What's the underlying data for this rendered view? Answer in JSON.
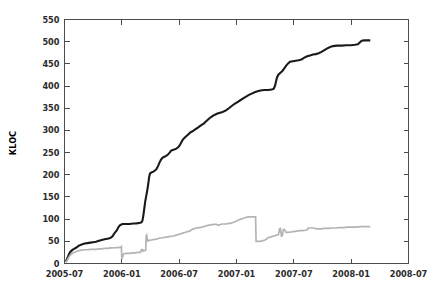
{
  "chart_data": {
    "type": "line",
    "title": "",
    "subtitle": "",
    "xlabel": "",
    "ylabel": "KLOC",
    "grid": false,
    "legend": "none",
    "xlim": [
      0,
      36
    ],
    "ylim": [
      0,
      550
    ],
    "x_tick_labels": [
      "2005-07",
      "2006-01",
      "2006-07",
      "2007-01",
      "2007-07",
      "2008-01",
      "2008-07"
    ],
    "x_tick_values": [
      0,
      6,
      12,
      18,
      24,
      30,
      36
    ],
    "y_tick_labels": [
      "0",
      "50",
      "100",
      "150",
      "200",
      "250",
      "300",
      "350",
      "400",
      "450",
      "500",
      "550"
    ],
    "y_tick_values": [
      0,
      50,
      100,
      150,
      200,
      250,
      300,
      350,
      400,
      450,
      500,
      550
    ],
    "series": [
      {
        "name": "total-lines",
        "color": "#1a1a1a",
        "width": 2.1,
        "points": [
          [
            0.15,
            4
          ],
          [
            0.3,
            12
          ],
          [
            0.45,
            20
          ],
          [
            0.6,
            26
          ],
          [
            0.8,
            30
          ],
          [
            1.0,
            33
          ],
          [
            1.25,
            36
          ],
          [
            1.5,
            40
          ],
          [
            1.8,
            43
          ],
          [
            2.1,
            45
          ],
          [
            2.4,
            46
          ],
          [
            2.7,
            47
          ],
          [
            3.0,
            48
          ],
          [
            3.3,
            49
          ],
          [
            3.6,
            51
          ],
          [
            3.9,
            53
          ],
          [
            4.1,
            54
          ],
          [
            4.3,
            55
          ],
          [
            4.5,
            56
          ],
          [
            4.7,
            57
          ],
          [
            4.9,
            59
          ],
          [
            5.05,
            62
          ],
          [
            5.15,
            66
          ],
          [
            5.3,
            70
          ],
          [
            5.45,
            74
          ],
          [
            5.55,
            78
          ],
          [
            5.65,
            82
          ],
          [
            5.8,
            86
          ],
          [
            5.95,
            88
          ],
          [
            6.1,
            89
          ],
          [
            6.4,
            89
          ],
          [
            6.8,
            89
          ],
          [
            7.2,
            90
          ],
          [
            7.5,
            90
          ],
          [
            7.7,
            91
          ],
          [
            7.9,
            92
          ],
          [
            8.05,
            93
          ],
          [
            8.15,
            96
          ],
          [
            8.25,
            108
          ],
          [
            8.35,
            124
          ],
          [
            8.45,
            140
          ],
          [
            8.55,
            152
          ],
          [
            8.62,
            160
          ],
          [
            8.7,
            170
          ],
          [
            8.78,
            182
          ],
          [
            8.86,
            195
          ],
          [
            8.95,
            203
          ],
          [
            9.1,
            205
          ],
          [
            9.3,
            207
          ],
          [
            9.5,
            210
          ],
          [
            9.65,
            214
          ],
          [
            9.8,
            220
          ],
          [
            9.95,
            228
          ],
          [
            10.1,
            234
          ],
          [
            10.25,
            238
          ],
          [
            10.4,
            240
          ],
          [
            10.6,
            242
          ],
          [
            10.8,
            245
          ],
          [
            11.0,
            250
          ],
          [
            11.15,
            254
          ],
          [
            11.3,
            256
          ],
          [
            11.5,
            257
          ],
          [
            11.7,
            259
          ],
          [
            11.9,
            262
          ],
          [
            12.05,
            266
          ],
          [
            12.2,
            272
          ],
          [
            12.35,
            278
          ],
          [
            12.5,
            282
          ],
          [
            12.65,
            285
          ],
          [
            12.8,
            288
          ],
          [
            13.0,
            292
          ],
          [
            13.2,
            296
          ],
          [
            13.4,
            298
          ],
          [
            13.6,
            301
          ],
          [
            13.8,
            304
          ],
          [
            14.0,
            307
          ],
          [
            14.2,
            310
          ],
          [
            14.4,
            313
          ],
          [
            14.6,
            316
          ],
          [
            14.8,
            320
          ],
          [
            15.0,
            324
          ],
          [
            15.2,
            328
          ],
          [
            15.4,
            331
          ],
          [
            15.6,
            334
          ],
          [
            15.8,
            336
          ],
          [
            16.0,
            338
          ],
          [
            16.3,
            340
          ],
          [
            16.6,
            342
          ],
          [
            16.9,
            345
          ],
          [
            17.2,
            350
          ],
          [
            17.5,
            355
          ],
          [
            17.8,
            360
          ],
          [
            18.1,
            364
          ],
          [
            18.4,
            368
          ],
          [
            18.7,
            372
          ],
          [
            19.0,
            376
          ],
          [
            19.3,
            380
          ],
          [
            19.6,
            383
          ],
          [
            19.9,
            386
          ],
          [
            20.2,
            388
          ],
          [
            20.5,
            390
          ],
          [
            20.9,
            391
          ],
          [
            21.3,
            391
          ],
          [
            21.7,
            392
          ],
          [
            21.9,
            394
          ],
          [
            22.05,
            402
          ],
          [
            22.15,
            412
          ],
          [
            22.25,
            420
          ],
          [
            22.4,
            426
          ],
          [
            22.6,
            430
          ],
          [
            22.8,
            434
          ],
          [
            23.0,
            440
          ],
          [
            23.2,
            446
          ],
          [
            23.4,
            451
          ],
          [
            23.6,
            455
          ],
          [
            23.9,
            456
          ],
          [
            24.2,
            457
          ],
          [
            24.5,
            458
          ],
          [
            24.8,
            460
          ],
          [
            25.1,
            464
          ],
          [
            25.4,
            467
          ],
          [
            25.7,
            469
          ],
          [
            26.0,
            471
          ],
          [
            26.3,
            472
          ],
          [
            26.6,
            474
          ],
          [
            26.9,
            477
          ],
          [
            27.2,
            481
          ],
          [
            27.5,
            485
          ],
          [
            27.8,
            488
          ],
          [
            28.1,
            490
          ],
          [
            28.5,
            491
          ],
          [
            29.0,
            491
          ],
          [
            29.5,
            492
          ],
          [
            30.0,
            492
          ],
          [
            30.4,
            493
          ],
          [
            30.7,
            494
          ],
          [
            30.9,
            498
          ],
          [
            31.1,
            502
          ],
          [
            31.4,
            503
          ],
          [
            31.8,
            503
          ],
          [
            32.0,
            503
          ]
        ]
      },
      {
        "name": "active-lines",
        "color": "#b4b4b4",
        "width": 1.7,
        "points": [
          [
            0.15,
            2
          ],
          [
            0.3,
            8
          ],
          [
            0.45,
            14
          ],
          [
            0.6,
            19
          ],
          [
            0.8,
            23
          ],
          [
            1.0,
            25
          ],
          [
            1.25,
            27
          ],
          [
            1.5,
            29
          ],
          [
            1.8,
            30
          ],
          [
            2.1,
            31
          ],
          [
            2.4,
            31
          ],
          [
            2.7,
            32
          ],
          [
            3.0,
            32
          ],
          [
            3.3,
            32
          ],
          [
            3.6,
            33
          ],
          [
            3.9,
            33
          ],
          [
            4.2,
            34
          ],
          [
            4.5,
            34
          ],
          [
            4.8,
            35
          ],
          [
            5.1,
            35
          ],
          [
            5.4,
            36
          ],
          [
            5.7,
            36
          ],
          [
            5.9,
            37
          ],
          [
            5.95,
            38
          ],
          [
            6.0,
            10
          ],
          [
            6.2,
            22
          ],
          [
            6.5,
            23
          ],
          [
            6.8,
            23
          ],
          [
            7.1,
            24
          ],
          [
            7.4,
            24
          ],
          [
            7.7,
            25
          ],
          [
            7.95,
            25
          ],
          [
            8.0,
            28
          ],
          [
            8.05,
            32
          ],
          [
            8.1,
            27
          ],
          [
            8.15,
            33
          ],
          [
            8.2,
            28
          ],
          [
            8.3,
            29
          ],
          [
            8.4,
            29
          ],
          [
            8.5,
            30
          ],
          [
            8.55,
            62
          ],
          [
            8.6,
            64
          ],
          [
            8.7,
            51
          ],
          [
            8.9,
            52
          ],
          [
            9.1,
            53
          ],
          [
            9.3,
            54
          ],
          [
            9.6,
            55
          ],
          [
            9.9,
            57
          ],
          [
            10.2,
            58
          ],
          [
            10.5,
            59
          ],
          [
            10.8,
            60
          ],
          [
            11.1,
            61
          ],
          [
            11.4,
            62
          ],
          [
            11.7,
            64
          ],
          [
            12.0,
            66
          ],
          [
            12.3,
            68
          ],
          [
            12.6,
            70
          ],
          [
            12.9,
            72
          ],
          [
            13.1,
            73
          ],
          [
            13.3,
            76
          ],
          [
            13.5,
            78
          ],
          [
            13.8,
            80
          ],
          [
            14.1,
            81
          ],
          [
            14.4,
            82
          ],
          [
            14.7,
            84
          ],
          [
            15.0,
            86
          ],
          [
            15.3,
            87
          ],
          [
            15.6,
            88
          ],
          [
            15.9,
            88
          ],
          [
            16.1,
            86
          ],
          [
            16.3,
            88
          ],
          [
            16.5,
            89
          ],
          [
            16.8,
            89
          ],
          [
            17.1,
            90
          ],
          [
            17.4,
            91
          ],
          [
            17.7,
            93
          ],
          [
            18.0,
            96
          ],
          [
            18.3,
            99
          ],
          [
            18.6,
            101
          ],
          [
            18.9,
            103
          ],
          [
            19.2,
            105
          ],
          [
            19.5,
            105
          ],
          [
            19.8,
            105
          ],
          [
            20.0,
            105
          ],
          [
            20.05,
            50
          ],
          [
            20.4,
            50
          ],
          [
            20.7,
            51
          ],
          [
            21.0,
            53
          ],
          [
            21.3,
            58
          ],
          [
            21.6,
            60
          ],
          [
            21.9,
            62
          ],
          [
            22.2,
            64
          ],
          [
            22.4,
            65
          ],
          [
            22.5,
            78
          ],
          [
            22.6,
            79
          ],
          [
            22.7,
            62
          ],
          [
            22.8,
            63
          ],
          [
            22.9,
            76
          ],
          [
            23.0,
            77
          ],
          [
            23.2,
            70
          ],
          [
            23.4,
            70
          ],
          [
            23.7,
            71
          ],
          [
            24.0,
            72
          ],
          [
            24.3,
            73
          ],
          [
            24.6,
            74
          ],
          [
            24.9,
            74
          ],
          [
            25.2,
            75
          ],
          [
            25.4,
            76
          ],
          [
            25.5,
            80
          ],
          [
            25.8,
            80
          ],
          [
            26.1,
            80
          ],
          [
            26.4,
            78
          ],
          [
            26.8,
            78
          ],
          [
            27.2,
            79
          ],
          [
            27.6,
            79
          ],
          [
            28.0,
            80
          ],
          [
            28.4,
            80
          ],
          [
            28.8,
            81
          ],
          [
            29.2,
            81
          ],
          [
            29.6,
            82
          ],
          [
            30.0,
            82
          ],
          [
            30.5,
            82
          ],
          [
            31.0,
            83
          ],
          [
            31.5,
            83
          ],
          [
            32.0,
            83
          ]
        ]
      }
    ]
  }
}
